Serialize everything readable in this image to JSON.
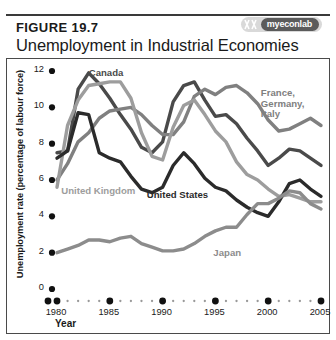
{
  "figure": {
    "number": "FIGURE 19.7",
    "title": "Unemployment in Industrial Economies",
    "badge_text": "myeconlab",
    "badge_icon": "myeconlab-logo-icon"
  },
  "chart_data": {
    "type": "line",
    "title": "Unemployment in Industrial Economies",
    "xlabel": "Year",
    "ylabel": "Unemployment rate (percentage of labour force)",
    "xlim": [
      1980,
      2005
    ],
    "ylim": [
      0,
      12
    ],
    "xticks": [
      "1980",
      "1985",
      "1990",
      "1995",
      "2000",
      "2005"
    ],
    "yticks": [
      "0",
      "2",
      "4",
      "6",
      "8",
      "10",
      "12"
    ],
    "grid": false,
    "legend": "inline-labels",
    "x": [
      1980,
      1981,
      1982,
      1983,
      1984,
      1985,
      1986,
      1987,
      1988,
      1989,
      1990,
      1991,
      1992,
      1993,
      1994,
      1995,
      1996,
      1997,
      1998,
      1999,
      2000,
      2001,
      2002,
      2003,
      2004,
      2005
    ],
    "series": [
      {
        "name": "Canada",
        "color": "#4a4a4a",
        "label_x": 1983.1,
        "label_y": 12.1,
        "values": [
          7.5,
          7.6,
          11.0,
          11.9,
          11.3,
          10.5,
          9.6,
          8.8,
          7.8,
          7.5,
          8.1,
          10.3,
          11.2,
          11.4,
          10.4,
          9.5,
          9.6,
          9.1,
          8.3,
          7.6,
          6.8,
          7.2,
          7.7,
          7.6,
          7.2,
          6.8
        ]
      },
      {
        "name": "France, Germany, Italy",
        "color": "#808080",
        "label_x": 1999.4,
        "label_y": 11.0,
        "values": [
          6.0,
          6.9,
          8.1,
          8.6,
          9.4,
          9.8,
          9.9,
          10.0,
          9.6,
          9.0,
          8.5,
          8.5,
          9.2,
          10.6,
          11.0,
          10.7,
          11.1,
          11.2,
          10.8,
          10.2,
          9.3,
          8.7,
          8.8,
          9.1,
          9.4,
          9.0
        ]
      },
      {
        "name": "United Kingdom",
        "color": "#9d9d9d",
        "label_x": 1980.5,
        "label_y": 5.6,
        "values": [
          5.6,
          9.0,
          10.4,
          11.2,
          11.3,
          11.4,
          11.4,
          10.5,
          8.6,
          7.3,
          7.1,
          8.9,
          10.1,
          10.4,
          9.6,
          8.7,
          8.1,
          7.0,
          6.3,
          6.0,
          5.5,
          5.1,
          5.2,
          5.0,
          4.8,
          4.8
        ]
      },
      {
        "name": "United States",
        "color": "#2b2b2b",
        "label_x": 1988.6,
        "label_y": 5.4,
        "values": [
          7.2,
          7.6,
          9.7,
          9.6,
          7.5,
          7.2,
          7.0,
          6.2,
          5.5,
          5.3,
          5.6,
          6.8,
          7.5,
          6.9,
          6.1,
          5.6,
          5.4,
          4.9,
          4.5,
          4.2,
          4.0,
          4.8,
          5.8,
          6.0,
          5.5,
          5.1
        ]
      },
      {
        "name": "Japan",
        "color": "#8c8c8c",
        "label_x": 1994.9,
        "label_y": 2.2,
        "values": [
          2.0,
          2.2,
          2.4,
          2.7,
          2.7,
          2.6,
          2.8,
          2.9,
          2.5,
          2.3,
          2.1,
          2.1,
          2.2,
          2.5,
          2.9,
          3.2,
          3.4,
          3.4,
          4.1,
          4.7,
          4.7,
          5.0,
          5.4,
          5.3,
          4.7,
          4.4
        ]
      }
    ]
  }
}
